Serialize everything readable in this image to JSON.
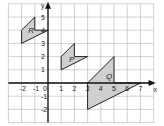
{
  "diagram": {
    "type": "coordinate-grid",
    "x_axis_label": "x",
    "y_axis_label": "y",
    "x_range": [
      -3,
      8
    ],
    "y_range": [
      -3,
      6
    ],
    "x_ticks": [
      "-2",
      "-1",
      "0",
      "1",
      "2",
      "3",
      "4",
      "5",
      "6",
      "7"
    ],
    "x_tick_values": [
      -2,
      -1,
      0,
      1,
      2,
      3,
      4,
      5,
      6,
      7
    ],
    "y_ticks": [
      "-2",
      "-1",
      "1",
      "2",
      "3",
      "4",
      "5"
    ],
    "y_tick_values": [
      -2,
      -1,
      1,
      2,
      3,
      4,
      5
    ],
    "shapes": [
      {
        "label": "R",
        "points": [
          [
            -2,
            3
          ],
          [
            -2,
            4
          ],
          [
            -1,
            5
          ],
          [
            -1,
            4
          ],
          [
            0,
            4
          ]
        ],
        "label_at": [
          -1.5,
          4
        ]
      },
      {
        "label": "P",
        "points": [
          [
            1,
            1
          ],
          [
            1,
            2
          ],
          [
            2,
            3
          ],
          [
            2,
            2
          ],
          [
            3,
            2
          ]
        ],
        "label_at": [
          1.6,
          1.8
        ]
      },
      {
        "label": "Q",
        "points": [
          [
            3,
            0
          ],
          [
            5,
            2
          ],
          [
            5,
            0
          ],
          [
            7,
            0
          ],
          [
            3,
            -2
          ]
        ],
        "label_at": [
          4.4,
          0.5
        ]
      }
    ],
    "colors": {
      "shape_fill": "#cfcfcf",
      "grid": "#bdbdbd",
      "axis": "#111111"
    }
  }
}
